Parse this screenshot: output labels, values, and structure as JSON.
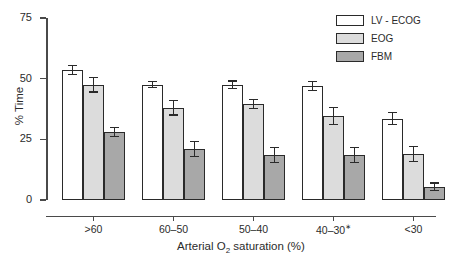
{
  "chart_data": {
    "type": "bar",
    "title": "",
    "xlabel": "Arterial O2 saturation (%)",
    "xlabel_main": "Arterial O",
    "xlabel_sub": "2",
    "xlabel_tail": " saturation (%)",
    "ylabel": "% Time",
    "ylim": [
      0,
      75
    ],
    "yticks": [
      0,
      25,
      50,
      75
    ],
    "ytick_labels": [
      "0",
      "25",
      "50",
      "75"
    ],
    "grid": false,
    "legend_position": "top-right",
    "categories": [
      ">60",
      "60–50",
      "50–40",
      "40–30",
      "<30"
    ],
    "category_notes": [
      "",
      "",
      "",
      "∗",
      ""
    ],
    "series": [
      {
        "name": "LV - ECOG",
        "color": "#ffffff",
        "values": [
          53.5,
          47.5,
          47.5,
          47.0,
          33.5
        ],
        "errors": [
          1.8,
          1.3,
          1.5,
          1.8,
          2.5
        ]
      },
      {
        "name": "EOG",
        "color": "#dcdcdc",
        "values": [
          47.5,
          38.0,
          39.5,
          34.5,
          19.0
        ],
        "errors": [
          3.0,
          3.0,
          1.8,
          3.5,
          3.0
        ]
      },
      {
        "name": "FBM",
        "color": "#a8a8a8",
        "values": [
          28.0,
          21.0,
          18.5,
          18.5,
          5.5
        ],
        "errors": [
          2.0,
          3.2,
          3.2,
          3.2,
          1.5
        ]
      }
    ]
  },
  "legend": {
    "items": [
      {
        "label": "LV - ECOG"
      },
      {
        "label": "EOG"
      },
      {
        "label": "FBM"
      }
    ]
  }
}
